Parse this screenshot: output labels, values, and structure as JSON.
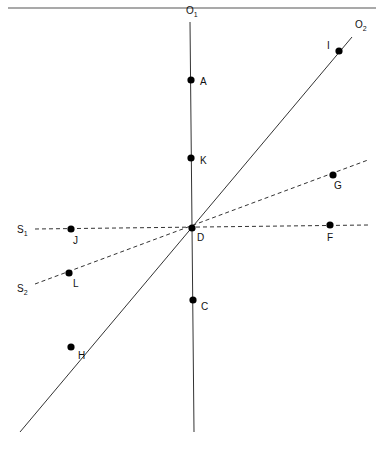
{
  "diagram": {
    "type": "geometric-lines-and-points",
    "header_rule": {
      "x1": 8,
      "y1": 8,
      "x2": 376,
      "y2": 8
    },
    "lines": [
      {
        "id": "O1",
        "label": "O",
        "subscript": "1",
        "style": "solid",
        "x1": 190,
        "y1": 22,
        "x2": 194,
        "y2": 432,
        "label_x": 186,
        "label_y": 14
      },
      {
        "id": "O2",
        "label": "O",
        "subscript": "2",
        "style": "solid",
        "x1": 20,
        "y1": 432,
        "x2": 352,
        "y2": 37,
        "label_x": 355,
        "label_y": 28
      },
      {
        "id": "S1",
        "label": "S",
        "subscript": "1",
        "style": "dashed",
        "x1": 35,
        "y1": 229,
        "x2": 368,
        "y2": 225,
        "label_x": 17,
        "label_y": 233
      },
      {
        "id": "S2",
        "label": "S",
        "subscript": "2",
        "style": "dashed",
        "x1": 35,
        "y1": 284,
        "x2": 368,
        "y2": 160,
        "label_x": 17,
        "label_y": 292
      }
    ],
    "points": [
      {
        "id": "A",
        "label": "A",
        "x": 191,
        "y": 80,
        "lx": 200,
        "ly": 85
      },
      {
        "id": "K",
        "label": "K",
        "x": 191,
        "y": 158,
        "lx": 200,
        "ly": 164
      },
      {
        "id": "D",
        "label": "D",
        "x": 192,
        "y": 228,
        "lx": 197,
        "ly": 241
      },
      {
        "id": "C",
        "label": "C",
        "x": 193,
        "y": 300,
        "lx": 201,
        "ly": 310
      },
      {
        "id": "I",
        "label": "I",
        "x": 339,
        "y": 51,
        "lx": 327,
        "ly": 49
      },
      {
        "id": "G",
        "label": "G",
        "x": 333,
        "y": 175,
        "lx": 334,
        "ly": 189
      },
      {
        "id": "F",
        "label": "F",
        "x": 330,
        "y": 225,
        "lx": 327,
        "ly": 241
      },
      {
        "id": "J",
        "label": "J",
        "x": 71,
        "y": 229,
        "lx": 73,
        "ly": 244
      },
      {
        "id": "L",
        "label": "L",
        "x": 69,
        "y": 273,
        "lx": 73,
        "ly": 287
      },
      {
        "id": "H",
        "label": "H",
        "x": 71,
        "y": 347,
        "lx": 78,
        "ly": 359
      }
    ],
    "colors": {
      "line": "#333333",
      "point": "#000000",
      "text": "#111111"
    }
  }
}
